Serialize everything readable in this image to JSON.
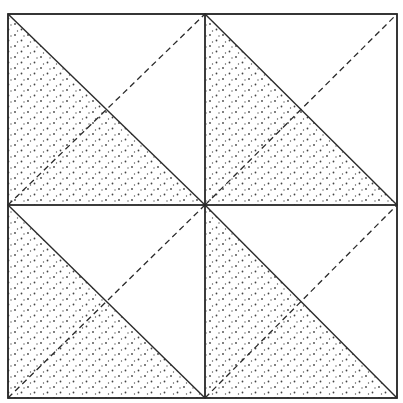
{
  "diagram": {
    "grid": {
      "rows": 2,
      "cols": 2
    },
    "outer_square": {
      "x0": 8,
      "y0": 14,
      "x1": 397,
      "y1": 398
    },
    "center": {
      "x": 205,
      "y": 205
    },
    "colors": {
      "line": "#2a2a2a",
      "stipple": "#444444",
      "background": "#ffffff"
    },
    "quadrants": [
      {
        "id": "top-left",
        "solid_diagonal": "tl-br",
        "dashed_diagonal": "bl-tr",
        "stippled_region": "lower-left-triangle"
      },
      {
        "id": "top-right",
        "solid_diagonal": "tl-br",
        "dashed_diagonal": "bl-tr",
        "stippled_region": "lower-left-triangle"
      },
      {
        "id": "bottom-left",
        "solid_diagonal": "tl-br",
        "dashed_diagonal": "bl-tr",
        "stippled_region": "lower-left-triangle"
      },
      {
        "id": "bottom-right",
        "solid_diagonal": "tl-br",
        "dashed_diagonal": "bl-tr",
        "stippled_region": "lower-left-triangle"
      }
    ]
  }
}
